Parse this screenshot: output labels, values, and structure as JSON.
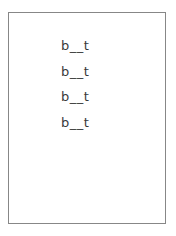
{
  "page": {
    "background_color": "#ffffff",
    "border_color": "#878787",
    "text_color": "#3a3a3a"
  },
  "worksheet": {
    "lines": [
      {
        "text": "b__t"
      },
      {
        "text": "b__t"
      },
      {
        "text": "b__t"
      },
      {
        "text": "b__t"
      }
    ]
  }
}
